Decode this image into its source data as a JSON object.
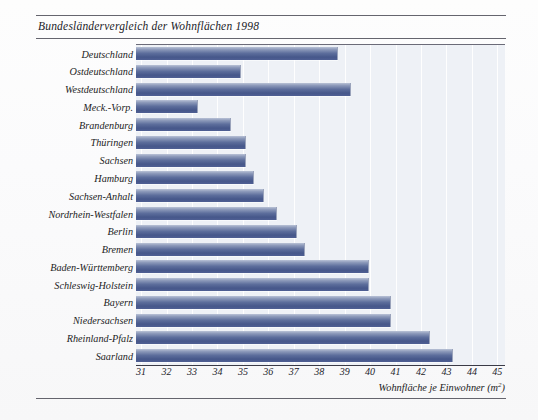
{
  "chart_data": {
    "type": "bar",
    "orientation": "horizontal",
    "title": "Bundesländervergleich der Wohnflächen 1998",
    "xlabel": "Wohnfläche je Einwohner (m²)",
    "ylabel": "",
    "xlim": [
      30.8,
      45.3
    ],
    "xticks": [
      31,
      32,
      33,
      34,
      35,
      36,
      37,
      38,
      39,
      40,
      41,
      42,
      43,
      44,
      45
    ],
    "grid": true,
    "grid_axis": "x",
    "legend": "none",
    "bar_color": "#4f5f93",
    "plot_background": "#eef1f6",
    "categories": [
      "Deutschland",
      "Ostdeutschland",
      "Westdeutschland",
      "Meck.-Vorp.",
      "Brandenburg",
      "Thüringen",
      "Sachsen",
      "Hamburg",
      "Sachsen-Anhalt",
      "Nordrhein-Westfalen",
      "Berlin",
      "Bremen",
      "Baden-Württemberg",
      "Schleswig-Holstein",
      "Bayern",
      "Niedersachsen",
      "Rheinland-Pfalz",
      "Saarland"
    ],
    "values": [
      38.7,
      34.9,
      39.2,
      33.2,
      34.5,
      35.1,
      35.1,
      35.4,
      35.8,
      36.3,
      37.1,
      37.4,
      39.9,
      39.9,
      40.8,
      40.8,
      42.3,
      43.2
    ]
  },
  "axis": {
    "tick_labels": [
      "31",
      "32",
      "33",
      "34",
      "35",
      "36",
      "37",
      "38",
      "39",
      "40",
      "41",
      "42",
      "43",
      "44",
      "45"
    ],
    "title_main": "Wohnfläche je Einwohner (m",
    "title_sup": "2",
    "title_close": ")"
  }
}
